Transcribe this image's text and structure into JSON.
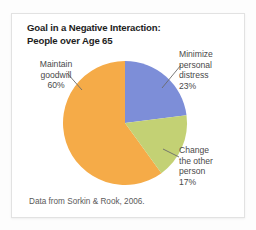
{
  "card": {
    "background": "#ffffff",
    "border_color": "#e2e2e2"
  },
  "title": "Goal in a Negative Interaction:\nPeople over Age 65",
  "source_note": "Data from Sorkin & Rook, 2006.",
  "labels": {
    "maintain": "Maintain\ngoodwill\n60%",
    "minimize": "Minimize\npersonal\ndistress\n23%",
    "change": "Change\nthe other\nperson\n17%"
  },
  "chart_data": {
    "type": "pie",
    "title": "Goal in a Negative Interaction: People over Age 65",
    "subtitle": "",
    "xlabel": "",
    "ylabel": "",
    "legend_position": "callout-labels",
    "grid": false,
    "start_angle_deg": 0,
    "direction": "clockwise",
    "source": "Data from Sorkin & Rook, 2006.",
    "categories": [
      "Minimize personal distress",
      "Change the other person",
      "Maintain goodwill"
    ],
    "values": [
      23,
      17,
      60
    ],
    "value_suffix": "%",
    "colors": [
      "#7d8ed8",
      "#c3d174",
      "#f5ab48"
    ],
    "slices": [
      {
        "label": "Minimize personal distress",
        "value": 23,
        "display": "23%",
        "color": "#7d8ed8",
        "start_deg": 0,
        "end_deg": 82.8
      },
      {
        "label": "Change the other person",
        "value": 17,
        "display": "17%",
        "color": "#c3d174",
        "start_deg": 82.8,
        "end_deg": 144.0
      },
      {
        "label": "Maintain goodwill",
        "value": 60,
        "display": "60%",
        "color": "#f5ab48",
        "start_deg": 144.0,
        "end_deg": 360.0
      }
    ],
    "total": 100,
    "center_px": [
      113,
      109
    ],
    "radius_px": 62
  }
}
